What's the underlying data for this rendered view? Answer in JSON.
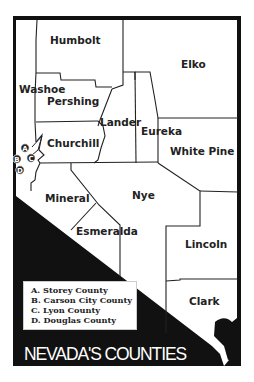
{
  "map": {
    "title": "NEVADA'S COUNTIES",
    "colors": {
      "background": "#ffffff",
      "frame": "#111111",
      "county_fill": "#ffffff",
      "border": "#222222",
      "label": "#222222"
    },
    "counties": [
      {
        "name": "Humbolt",
        "label": "Humbolt"
      },
      {
        "name": "Elko",
        "label": "Elko"
      },
      {
        "name": "Washoe",
        "label": "Washoe"
      },
      {
        "name": "Pershing",
        "label": "Pershing"
      },
      {
        "name": "Lander",
        "label": "Lander"
      },
      {
        "name": "Eureka",
        "label": "Eureka"
      },
      {
        "name": "Churchill",
        "label": "Churchill"
      },
      {
        "name": "White Pine",
        "label": "White Pine"
      },
      {
        "name": "Mineral",
        "label": "Mineral"
      },
      {
        "name": "Nye",
        "label": "Nye"
      },
      {
        "name": "Esmeralda",
        "label": "Esmeralda"
      },
      {
        "name": "Lincoln",
        "label": "Lincoln"
      },
      {
        "name": "Clark",
        "label": "Clark"
      }
    ],
    "markers": [
      {
        "letter": "A",
        "county": "Storey County"
      },
      {
        "letter": "B",
        "county": "Carson City County"
      },
      {
        "letter": "C",
        "county": "Lyon County"
      },
      {
        "letter": "D",
        "county": "Douglas County"
      }
    ],
    "legend": [
      "A.  Storey County",
      "B.  Carson City County",
      "C.  Lyon County",
      "D.  Douglas County"
    ]
  }
}
